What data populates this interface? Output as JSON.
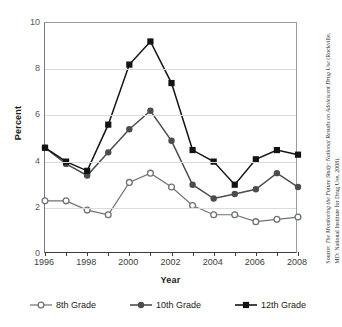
{
  "chart_data": {
    "type": "line",
    "title": "",
    "xlabel": "Year",
    "ylabel": "Percent",
    "xlim": [
      1996,
      2008
    ],
    "ylim": [
      0,
      10
    ],
    "ytick_labels": [
      "0",
      "2",
      "4",
      "6",
      "8",
      "10"
    ],
    "ytick_values": [
      0,
      2,
      4,
      6,
      8,
      10
    ],
    "xtick_labels": [
      "1996",
      "1998",
      "2000",
      "2002",
      "2004",
      "2006",
      "2008"
    ],
    "xtick_values": [
      1996,
      1998,
      2000,
      2002,
      2004,
      2006,
      2008
    ],
    "x": [
      1996,
      1997,
      1998,
      1999,
      2000,
      2001,
      2002,
      2003,
      2004,
      2005,
      2006,
      2007,
      2008
    ],
    "grid": "horizontal",
    "legend_position": "bottom",
    "series": [
      {
        "name": "8th Grade",
        "marker": "open-circle",
        "color": "#6e7274",
        "values": [
          2.3,
          2.3,
          1.9,
          1.7,
          3.1,
          3.5,
          2.9,
          2.1,
          1.7,
          1.7,
          1.4,
          1.5,
          1.6
        ]
      },
      {
        "name": "10th Grade",
        "marker": "filled-circle",
        "color": "#4a4d50",
        "values": [
          4.6,
          3.9,
          3.4,
          4.4,
          5.4,
          6.2,
          4.9,
          3.0,
          2.4,
          2.6,
          2.8,
          3.5,
          2.9
        ]
      },
      {
        "name": "12th Grade",
        "marker": "filled-square",
        "color": "#111315",
        "values": [
          4.6,
          4.0,
          3.6,
          5.6,
          8.2,
          9.2,
          7.4,
          4.5,
          4.0,
          3.0,
          4.1,
          4.5,
          4.3
        ]
      }
    ]
  },
  "source": {
    "prefix": "Source: ",
    "italic_title": "The Monitoring the Future Study: National Results on Adolescent Drug Use",
    "suffix": " (Rockville, MD: National Institute for Drug Use, 2008)."
  }
}
